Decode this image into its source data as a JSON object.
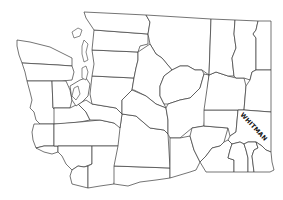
{
  "map": {
    "region": "Washington State",
    "subdivision": "counties",
    "labels": [
      {
        "id": "whitman",
        "text": "WHITMAN"
      }
    ],
    "colors": {
      "background": "#ffffff",
      "outline": "#3a3a3a",
      "label": "#111111"
    }
  }
}
